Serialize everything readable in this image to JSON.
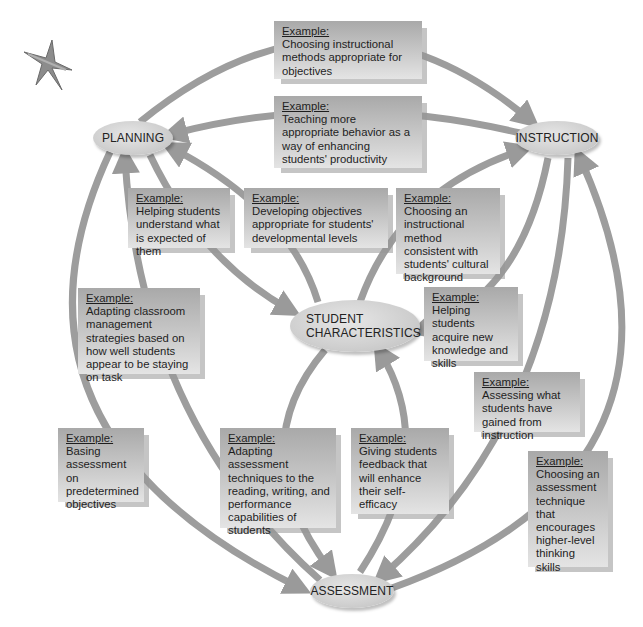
{
  "nodes": {
    "planning": "PLANNING",
    "instruction": "INSTRUCTION",
    "student_characteristics_line1": "STUDENT",
    "student_characteristics_line2": "CHARACTERISTICS",
    "assessment": "ASSESSMENT"
  },
  "example_label": "Example:",
  "examples": [
    {
      "id": "planning-to-instruction",
      "text": "Choosing instructional methods appropriate for objectives"
    },
    {
      "id": "instruction-to-planning",
      "text": "Teaching more appropriate behavior as a way of enhancing students' productivity"
    },
    {
      "id": "student-to-planning",
      "text": "Helping students understand what is expected of them"
    },
    {
      "id": "planning-student-objectives",
      "text": "Developing objectives appropriate for students' developmental levels"
    },
    {
      "id": "student-to-instruction",
      "text": "Choosing an instructional method consistent with students' cultural background"
    },
    {
      "id": "assessment-to-planning",
      "text": "Adapting classroom management strategies based on how well students appear to be staying on task"
    },
    {
      "id": "instruction-to-student",
      "text": "Helping students acquire new knowledge and skills"
    },
    {
      "id": "instruction-to-assessment",
      "text": "Assessing what students have gained from instruction"
    },
    {
      "id": "planning-to-assessment",
      "text": "Basing assessment on predetermined objectives"
    },
    {
      "id": "student-to-assessment",
      "text": "Adapting assessment techniques to the reading, writing, and performance capabilities of students"
    },
    {
      "id": "assessment-to-student",
      "text": "Giving students feedback that will enhance their self-efficacy"
    },
    {
      "id": "assessment-to-instruction",
      "text": "Choosing an assessment technique that encourages higher-level thinking skills"
    }
  ],
  "colors": {
    "arrow": "#9a9a9a",
    "node_fill": "#d2d2d2",
    "box_top": "#a9a9a9",
    "box_bottom": "#e4e4e4"
  }
}
